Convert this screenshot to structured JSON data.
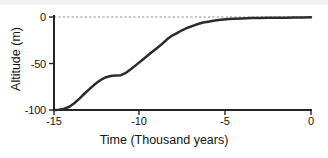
{
  "chart_data": {
    "type": "line",
    "title": "",
    "xlabel": "Time (Thousand years)",
    "ylabel": "Altitude (m)",
    "xlim": [
      -15,
      0
    ],
    "ylim": [
      -100,
      5
    ],
    "xticks": [
      -15,
      -10,
      -5,
      0
    ],
    "xtick_labels": [
      "-15",
      "-10",
      "-5",
      "0"
    ],
    "yticks": [
      0,
      -50,
      -100
    ],
    "ytick_labels": [
      "0",
      "-50",
      "-100"
    ],
    "grid": false,
    "legend": null,
    "reference_line": {
      "orientation": "horizontal",
      "value": 0,
      "style": "dashed",
      "color": "#8c8c8c"
    },
    "series": [
      {
        "name": "Sea level / altitude curve",
        "color": "#2b2b2b",
        "linewidth": 2.5,
        "x": [
          -15.0,
          -14.7,
          -14.4,
          -14.1,
          -13.8,
          -13.5,
          -13.2,
          -12.9,
          -12.6,
          -12.3,
          -12.0,
          -11.7,
          -11.4,
          -11.1,
          -10.8,
          -10.5,
          -10.2,
          -9.9,
          -9.6,
          -9.3,
          -9.0,
          -8.7,
          -8.4,
          -8.1,
          -7.8,
          -7.5,
          -7.2,
          -6.9,
          -6.6,
          -6.3,
          -6.0,
          -5.7,
          -5.4,
          -5.1,
          -4.8,
          -4.5,
          -4.0,
          -3.5,
          -3.0,
          -2.5,
          -2.0,
          -1.5,
          -1.0,
          -0.5,
          0.0
        ],
        "y": [
          -100.0,
          -99.6,
          -98.6,
          -96.5,
          -92.5,
          -87.5,
          -82.0,
          -77.0,
          -72.0,
          -68.0,
          -65.0,
          -63.5,
          -63.0,
          -62.5,
          -60.0,
          -56.0,
          -51.5,
          -47.0,
          -42.5,
          -38.0,
          -33.5,
          -29.0,
          -24.0,
          -20.0,
          -17.0,
          -14.0,
          -11.5,
          -9.5,
          -7.5,
          -6.0,
          -5.0,
          -4.0,
          -3.2,
          -2.6,
          -2.2,
          -1.9,
          -1.5,
          -1.2,
          -1.0,
          -0.9,
          -0.8,
          -0.7,
          -0.6,
          -0.5,
          -0.4
        ]
      }
    ],
    "annotations": []
  },
  "axes": {
    "y_tick_0": "0",
    "y_tick_1": "-50",
    "y_tick_2": "-100",
    "x_tick_0": "-15",
    "x_tick_1": "-10",
    "x_tick_2": "-5",
    "x_tick_3": "0",
    "x_axis_title": "Time (Thousand years)",
    "y_axis_title": "Altitude (m)"
  },
  "style": {
    "axis_color": "#262626",
    "curve_color": "#2b2b2b",
    "reference_color": "#8c8c8c",
    "background": "#ffffff",
    "band_color": "#f2f2f2"
  }
}
